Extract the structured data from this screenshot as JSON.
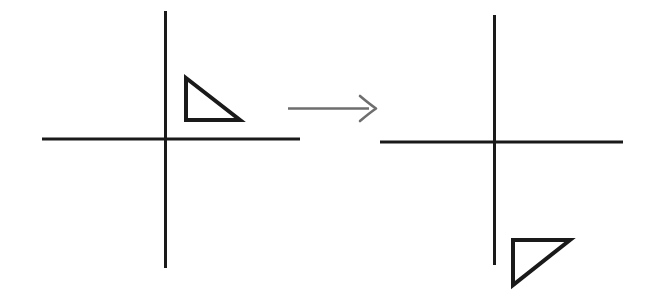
{
  "page": {
    "background_color": "#ffffff",
    "width": 656,
    "height": 306
  },
  "style": {
    "axis_color": "#1a1a1a",
    "axis_stroke_width": 3,
    "shape_color": "#1a1a1a",
    "shape_stroke_width": 4,
    "arrow_color": "#6e6e6e",
    "arrow_stroke_width": 2.6
  },
  "chart_data": {
    "type": "diagram",
    "title": "Reflection of a right triangle across the x-axis",
    "panels": [
      {
        "name": "before",
        "label": "",
        "axes": {
          "origin": [
            165,
            139
          ],
          "x_axis": {
            "x1": 42,
            "y1": 139,
            "x2": 300,
            "y2": 139
          },
          "y_axis": {
            "x1": 165,
            "y1": 11,
            "x2": 165,
            "y2": 268
          }
        },
        "shape": {
          "name": "right-triangle",
          "quadrant": "upper-right",
          "right_angle_vertex": [
            186,
            120
          ],
          "vertices": [
            [
              186,
              78
            ],
            [
              186,
              120
            ],
            [
              240,
              120
            ]
          ],
          "closed": true,
          "filled": false
        }
      },
      {
        "name": "after",
        "label": "",
        "axes": {
          "origin": [
            494,
            142
          ],
          "x_axis": {
            "x1": 380,
            "y1": 142,
            "x2": 623,
            "y2": 142
          },
          "y_axis": {
            "x1": 494,
            "y1": 15,
            "x2": 494,
            "y2": 265
          }
        },
        "shape": {
          "name": "right-triangle",
          "quadrant": "lower-right",
          "right_angle_vertex": [
            513,
            240
          ],
          "vertices": [
            [
              513,
              240
            ],
            [
              570,
              240
            ],
            [
              513,
              285
            ]
          ],
          "closed": true,
          "filled": false
        }
      }
    ],
    "connector": {
      "name": "transformation-arrow",
      "type": "arrow",
      "direction": "right",
      "start": [
        288,
        108
      ],
      "end": [
        376,
        108
      ],
      "label": ""
    }
  }
}
